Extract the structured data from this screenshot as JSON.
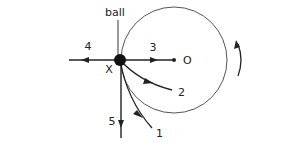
{
  "diagram": {
    "labels": {
      "ball": "ball",
      "origin": "O",
      "point_x": "X",
      "path_1": "1",
      "path_2": "2",
      "path_3": "3",
      "path_4": "4",
      "path_5": "5"
    },
    "colors": {
      "stroke": "#222222",
      "circle": "#555555"
    },
    "rotation_direction": "counter-clockwise"
  }
}
